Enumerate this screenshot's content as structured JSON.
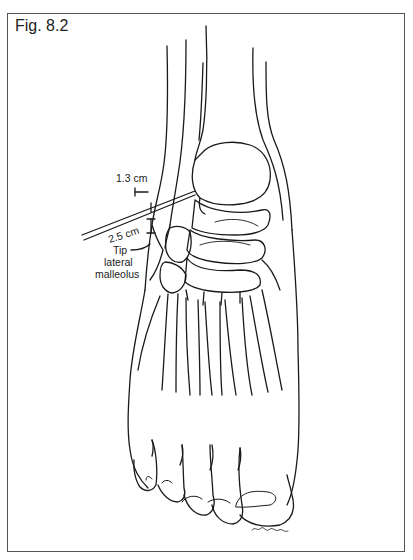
{
  "figure": {
    "label": "Fig. 8.2",
    "annotations": {
      "distance_1": "1.3 cm",
      "distance_2": "2.5 cm",
      "landmark_line1": "Tip",
      "landmark_line2": "lateral",
      "landmark_line3": "malleolus"
    },
    "signature": "artist-signature",
    "colors": {
      "line": "#1a1a1a",
      "frame": "#555555",
      "background": "#ffffff"
    }
  }
}
